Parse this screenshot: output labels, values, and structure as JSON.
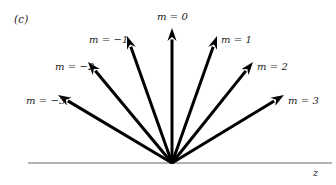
{
  "figure": {
    "panel_tag": "(c)",
    "axis_label": "z",
    "background_color": "#ffffff",
    "arrow_color": "#000000",
    "baseline_color": "#9a9a9a",
    "text_color": "#1a1a1a"
  },
  "geometry": {
    "origin_x": 172,
    "origin_y": 163,
    "baseline_x_start": 28,
    "baseline_x_end": 332,
    "baseline_y": 163,
    "arrow_stroke_width": 3.0,
    "baseline_stroke_width": 1.4
  },
  "chart_data": {
    "type": "diagram",
    "title": "",
    "xlabel": "z",
    "ylabel": "",
    "quantum_number_symbol": "m",
    "vectors": [
      {
        "label": "m = −3",
        "m": -3,
        "angle_deg_from_z_axis": 148,
        "tip_x": 58,
        "tip_y": 95,
        "label_x": 26,
        "label_y": 95
      },
      {
        "label": "m = −2",
        "m": -2,
        "angle_deg_from_z_axis": 124,
        "tip_x": 88,
        "tip_y": 62,
        "label_x": 55,
        "label_y": 61
      },
      {
        "label": "m = −1",
        "m": -1,
        "angle_deg_from_z_axis": 108,
        "tip_x": 127,
        "tip_y": 36,
        "label_x": 89,
        "label_y": 34
      },
      {
        "label": "m = 0",
        "m": 0,
        "angle_deg_from_z_axis": 90,
        "tip_x": 172,
        "tip_y": 28,
        "label_x": 157,
        "label_y": 11
      },
      {
        "label": "m = 1",
        "m": 1,
        "angle_deg_from_z_axis": 72,
        "tip_x": 217,
        "tip_y": 36,
        "label_x": 221,
        "label_y": 34
      },
      {
        "label": "m = 2",
        "m": 2,
        "angle_deg_from_z_axis": 56,
        "tip_x": 253,
        "tip_y": 62,
        "label_x": 257,
        "label_y": 61
      },
      {
        "label": "m = 3",
        "m": 3,
        "angle_deg_from_z_axis": 32,
        "tip_x": 284,
        "tip_y": 95,
        "label_x": 288,
        "label_y": 95
      }
    ]
  }
}
